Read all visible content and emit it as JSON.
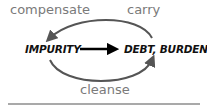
{
  "diagram": {
    "nodes": {
      "left": "IMPURITY",
      "right": "DEBT, BURDEN"
    },
    "edges": {
      "top_left_label": "compensate",
      "top_right_label": "carry",
      "bottom_label": "cleanse"
    },
    "colors": {
      "arc": "#555555",
      "label": "#7a7a7a",
      "node": "#111111",
      "main_arrow": "#000000",
      "rule": "#555555"
    }
  }
}
